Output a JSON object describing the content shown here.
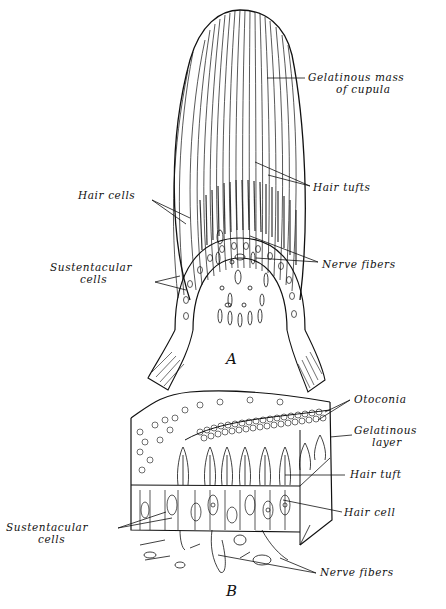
{
  "figure_a": {
    "letter": "A",
    "labels": {
      "gelatinous_mass_1": "Gelatinous mass",
      "gelatinous_mass_2": "of cupula",
      "hair_tufts": "Hair tufts",
      "hair_cells": "Hair cells",
      "sustentacular_1": "Sustentacular",
      "sustentacular_2": "cells",
      "nerve_fibers": "Nerve fibers"
    }
  },
  "figure_b": {
    "letter": "B",
    "labels": {
      "otoconia": "Otoconia",
      "gelatinous_layer_1": "Gelatinous",
      "gelatinous_layer_2": "layer",
      "hair_tuft": "Hair tuft",
      "hair_cell": "Hair cell",
      "sustentacular_1": "Sustentacular",
      "sustentacular_2": "cells",
      "nerve_fibers": "Nerve fibers"
    }
  }
}
